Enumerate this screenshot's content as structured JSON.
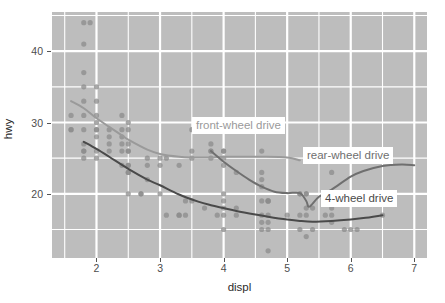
{
  "chart_data": {
    "type": "scatter",
    "title": "",
    "xlabel": "displ",
    "ylabel": "hwy",
    "xlim": [
      1.3,
      7.2
    ],
    "ylim": [
      11.0,
      45.5
    ],
    "grid": true,
    "legend_position": "direct-labels-on-plot",
    "x_ticks": [
      "2",
      "3",
      "4",
      "5",
      "6",
      "7"
    ],
    "x_tick_values": [
      2,
      3,
      4,
      5,
      6,
      7
    ],
    "x_minor_ticks": [
      1.5,
      2.5,
      3.5,
      4.5,
      5.5,
      6.5
    ],
    "y_ticks": [
      "20",
      "30",
      "40"
    ],
    "y_tick_values": [
      20,
      30,
      40
    ],
    "y_minor_ticks": [
      15,
      25,
      35,
      45
    ],
    "point_color": "#8c8c8c",
    "panel_background": "#bdbdbd",
    "grid_color": "#ffffff",
    "series": [
      {
        "name": "front-wheel drive",
        "label": "front-wheel drive",
        "color": "#9a9a9a",
        "label_x": 4.5,
        "label_y": 29.2,
        "smooth": {
          "x": [
            1.6,
            1.8,
            2.0,
            2.2,
            2.4,
            2.5,
            2.8,
            3.0,
            3.3,
            3.5,
            3.8,
            4.0,
            4.6,
            5.0,
            5.2
          ],
          "y": [
            33.0,
            32.0,
            30.6,
            29.4,
            28.2,
            27.6,
            26.2,
            25.6,
            25.2,
            25.1,
            25.1,
            25.2,
            25.2,
            25.1,
            24.7
          ]
        },
        "points": [
          {
            "x": 1.6,
            "y": 29
          },
          {
            "x": 1.6,
            "y": 29
          },
          {
            "x": 1.6,
            "y": 31
          },
          {
            "x": 1.8,
            "y": 26
          },
          {
            "x": 1.8,
            "y": 27
          },
          {
            "x": 1.8,
            "y": 29
          },
          {
            "x": 1.8,
            "y": 31
          },
          {
            "x": 1.8,
            "y": 33
          },
          {
            "x": 1.8,
            "y": 35
          },
          {
            "x": 1.8,
            "y": 37
          },
          {
            "x": 1.8,
            "y": 41
          },
          {
            "x": 1.8,
            "y": 44
          },
          {
            "x": 1.9,
            "y": 44
          },
          {
            "x": 2.0,
            "y": 28
          },
          {
            "x": 2.0,
            "y": 29
          },
          {
            "x": 2.0,
            "y": 29
          },
          {
            "x": 2.0,
            "y": 30
          },
          {
            "x": 2.0,
            "y": 31
          },
          {
            "x": 2.0,
            "y": 33
          },
          {
            "x": 2.0,
            "y": 35
          },
          {
            "x": 2.2,
            "y": 26
          },
          {
            "x": 2.2,
            "y": 27
          },
          {
            "x": 2.2,
            "y": 28
          },
          {
            "x": 2.2,
            "y": 29
          },
          {
            "x": 2.4,
            "y": 24
          },
          {
            "x": 2.4,
            "y": 26
          },
          {
            "x": 2.4,
            "y": 27
          },
          {
            "x": 2.4,
            "y": 28
          },
          {
            "x": 2.4,
            "y": 29
          },
          {
            "x": 2.4,
            "y": 31
          },
          {
            "x": 2.5,
            "y": 23
          },
          {
            "x": 2.5,
            "y": 24
          },
          {
            "x": 2.5,
            "y": 26
          },
          {
            "x": 2.5,
            "y": 27
          },
          {
            "x": 2.5,
            "y": 29
          },
          {
            "x": 2.5,
            "y": 30
          },
          {
            "x": 2.7,
            "y": 20
          },
          {
            "x": 2.8,
            "y": 24
          },
          {
            "x": 2.8,
            "y": 25
          },
          {
            "x": 3.0,
            "y": 24
          },
          {
            "x": 3.0,
            "y": 25
          },
          {
            "x": 3.1,
            "y": 25
          },
          {
            "x": 3.3,
            "y": 17
          },
          {
            "x": 3.3,
            "y": 24
          },
          {
            "x": 3.4,
            "y": 17
          },
          {
            "x": 3.5,
            "y": 25
          },
          {
            "x": 3.5,
            "y": 26
          },
          {
            "x": 3.5,
            "y": 29
          },
          {
            "x": 3.8,
            "y": 25
          },
          {
            "x": 3.8,
            "y": 26
          },
          {
            "x": 3.8,
            "y": 27
          },
          {
            "x": 4.0,
            "y": 25
          },
          {
            "x": 4.0,
            "y": 26
          },
          {
            "x": 4.6,
            "y": 26
          },
          {
            "x": 5.2,
            "y": 20
          },
          {
            "x": 5.3,
            "y": 20
          },
          {
            "x": 5.3,
            "y": 25
          },
          {
            "x": 5.7,
            "y": 23
          }
        ]
      },
      {
        "name": "rear-wheel drive",
        "label": "rear-wheel drive",
        "color": "#6f6f6f",
        "label_x": 6.3,
        "label_y": 25.3,
        "smooth": {
          "x": [
            3.8,
            4.0,
            4.2,
            4.4,
            4.6,
            4.8,
            5.0,
            5.2,
            5.3,
            5.35,
            5.5,
            5.7,
            6.0,
            6.2,
            6.5,
            6.8,
            7.0
          ],
          "y": [
            26.0,
            24.5,
            23.2,
            22.0,
            21.0,
            20.3,
            20.1,
            20.1,
            19.0,
            18.2,
            19.6,
            20.6,
            22.4,
            23.2,
            23.9,
            24.1,
            24.0
          ]
        },
        "points": [
          {
            "x": 3.8,
            "y": 26
          },
          {
            "x": 4.0,
            "y": 26
          },
          {
            "x": 4.0,
            "y": 24
          },
          {
            "x": 4.2,
            "y": 23
          },
          {
            "x": 4.6,
            "y": 22
          },
          {
            "x": 4.6,
            "y": 23
          },
          {
            "x": 4.6,
            "y": 21
          },
          {
            "x": 4.7,
            "y": 19
          },
          {
            "x": 4.7,
            "y": 19
          },
          {
            "x": 5.2,
            "y": 20
          },
          {
            "x": 5.3,
            "y": 20
          },
          {
            "x": 5.3,
            "y": 18
          },
          {
            "x": 5.7,
            "y": 17
          },
          {
            "x": 5.7,
            "y": 18
          },
          {
            "x": 6.1,
            "y": 15
          },
          {
            "x": 5.4,
            "y": 18
          }
        ]
      },
      {
        "name": "4-wheel drive",
        "label": "4-wheel drive",
        "color": "#4a4a4a",
        "label_x": 6.25,
        "label_y": 19.6,
        "smooth": {
          "x": [
            1.8,
            2.0,
            2.2,
            2.5,
            2.8,
            3.0,
            3.3,
            3.6,
            3.8,
            4.0,
            4.2,
            4.5,
            4.7,
            5.0,
            5.2,
            5.4,
            5.7,
            6.0,
            6.2,
            6.5
          ],
          "y": [
            27.3,
            26.3,
            25.2,
            23.5,
            22.0,
            21.2,
            19.9,
            18.9,
            18.4,
            18.0,
            17.6,
            17.1,
            16.8,
            16.4,
            16.2,
            16.1,
            16.2,
            16.4,
            16.6,
            17.0
          ]
        },
        "points": [
          {
            "x": 1.8,
            "y": 26
          },
          {
            "x": 1.8,
            "y": 25
          },
          {
            "x": 2.0,
            "y": 26
          },
          {
            "x": 2.0,
            "y": 25
          },
          {
            "x": 2.5,
            "y": 23
          },
          {
            "x": 2.5,
            "y": 24
          },
          {
            "x": 2.5,
            "y": 26
          },
          {
            "x": 2.5,
            "y": 20
          },
          {
            "x": 2.7,
            "y": 20
          },
          {
            "x": 2.8,
            "y": 22
          },
          {
            "x": 3.0,
            "y": 20
          },
          {
            "x": 3.1,
            "y": 17
          },
          {
            "x": 3.3,
            "y": 17
          },
          {
            "x": 3.4,
            "y": 19
          },
          {
            "x": 3.5,
            "y": 19
          },
          {
            "x": 3.7,
            "y": 18
          },
          {
            "x": 3.9,
            "y": 17
          },
          {
            "x": 4.0,
            "y": 20
          },
          {
            "x": 4.0,
            "y": 19
          },
          {
            "x": 4.0,
            "y": 18
          },
          {
            "x": 4.0,
            "y": 17
          },
          {
            "x": 4.0,
            "y": 15
          },
          {
            "x": 4.2,
            "y": 17
          },
          {
            "x": 4.2,
            "y": 18
          },
          {
            "x": 4.6,
            "y": 19
          },
          {
            "x": 4.6,
            "y": 17
          },
          {
            "x": 4.6,
            "y": 16
          },
          {
            "x": 4.6,
            "y": 15
          },
          {
            "x": 4.7,
            "y": 19
          },
          {
            "x": 4.7,
            "y": 17
          },
          {
            "x": 4.7,
            "y": 16
          },
          {
            "x": 4.7,
            "y": 15
          },
          {
            "x": 4.7,
            "y": 12
          },
          {
            "x": 5.0,
            "y": 17
          },
          {
            "x": 5.2,
            "y": 15
          },
          {
            "x": 5.2,
            "y": 17
          },
          {
            "x": 5.3,
            "y": 17
          },
          {
            "x": 5.3,
            "y": 14
          },
          {
            "x": 5.4,
            "y": 15
          },
          {
            "x": 5.6,
            "y": 17
          },
          {
            "x": 5.7,
            "y": 16
          },
          {
            "x": 5.9,
            "y": 15
          },
          {
            "x": 6.0,
            "y": 15
          },
          {
            "x": 6.5,
            "y": 17
          }
        ]
      }
    ]
  }
}
